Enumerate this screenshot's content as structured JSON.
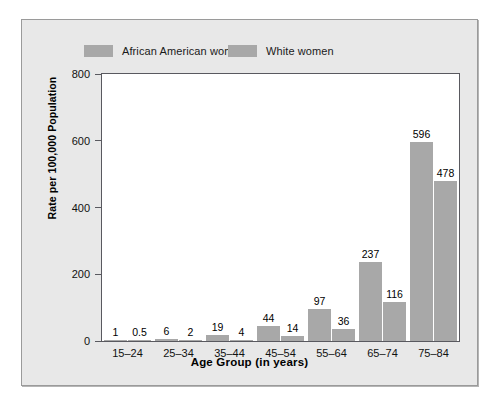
{
  "chart_data": {
    "type": "bar",
    "title": "",
    "xlabel": "Age Group (in years)",
    "ylabel": "Rate per 100,000 Population",
    "categories": [
      "15–24",
      "25–34",
      "35–44",
      "45–54",
      "55–64",
      "65–74",
      "75–84"
    ],
    "series": [
      {
        "name": "African American women",
        "color": "#a8a8a8",
        "values": [
          1,
          6,
          19,
          44,
          97,
          237,
          596
        ],
        "labels": [
          "1",
          "6",
          "19",
          "44",
          "97",
          "237",
          "596"
        ]
      },
      {
        "name": "White women",
        "color": "#a8a8a8",
        "values": [
          0.5,
          2,
          4,
          14,
          36,
          116,
          478
        ],
        "labels": [
          "0.5",
          "2",
          "4",
          "14",
          "36",
          "116",
          "478"
        ]
      }
    ],
    "ylim": [
      0,
      800
    ],
    "yticks": [
      0,
      200,
      400,
      600,
      800
    ],
    "ytick_labels": [
      "0",
      "200",
      "400",
      "600",
      "800"
    ],
    "grid": false,
    "legend_position": "top"
  },
  "colors": {
    "panel_background": "#e8e8e8",
    "plot_background": "#ffffff",
    "bar": "#a8a8a8",
    "axis": "#59595f",
    "text": "#000000"
  }
}
